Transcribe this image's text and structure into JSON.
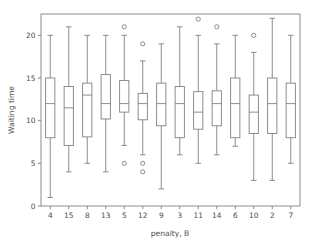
{
  "chart_data": {
    "type": "box",
    "title": "",
    "xlabel": "penalty, B",
    "ylabel": "Waiting time",
    "categories": [
      "4",
      "15",
      "8",
      "13",
      "5",
      "12",
      "9",
      "3",
      "11",
      "14",
      "6",
      "10",
      "2",
      "7"
    ],
    "ylim": [
      0,
      22.5
    ],
    "yticks": [
      0,
      5,
      10,
      15,
      20
    ],
    "ytick_labels": [
      "0",
      "5",
      "10",
      "15",
      "20"
    ],
    "grid": false,
    "legend": null,
    "boxes": [
      {
        "category": "4",
        "whisker_low": 1.0,
        "q1": 8.0,
        "median": 12.0,
        "q3": 15.0,
        "whisker_high": 20.0,
        "outliers": []
      },
      {
        "category": "15",
        "whisker_low": 4.0,
        "q1": 7.1,
        "median": 11.5,
        "q3": 14.0,
        "whisker_high": 21.0,
        "outliers": []
      },
      {
        "category": "8",
        "whisker_low": 5.0,
        "q1": 8.1,
        "median": 13.0,
        "q3": 14.4,
        "whisker_high": 20.0,
        "outliers": []
      },
      {
        "category": "13",
        "whisker_low": 4.0,
        "q1": 10.2,
        "median": 12.0,
        "q3": 15.4,
        "whisker_high": 20.0,
        "outliers": []
      },
      {
        "category": "5",
        "whisker_low": 7.1,
        "q1": 11.0,
        "median": 12.0,
        "q3": 14.7,
        "whisker_high": 20.0,
        "outliers": [
          21.0,
          5.0
        ]
      },
      {
        "category": "12",
        "whisker_low": 6.0,
        "q1": 10.1,
        "median": 12.0,
        "q3": 13.2,
        "whisker_high": 17.0,
        "outliers": [
          19.0,
          5.0,
          4.0
        ]
      },
      {
        "category": "9",
        "whisker_low": 2.0,
        "q1": 9.4,
        "median": 12.0,
        "q3": 14.4,
        "whisker_high": 19.0,
        "outliers": []
      },
      {
        "category": "3",
        "whisker_low": 6.0,
        "q1": 8.0,
        "median": 12.0,
        "q3": 14.0,
        "whisker_high": 21.0,
        "outliers": []
      },
      {
        "category": "11",
        "whisker_low": 5.0,
        "q1": 9.0,
        "median": 11.0,
        "q3": 13.4,
        "whisker_high": 20.0,
        "outliers": [
          21.9
        ]
      },
      {
        "category": "14",
        "whisker_low": 6.0,
        "q1": 9.4,
        "median": 12.0,
        "q3": 13.5,
        "whisker_high": 19.0,
        "outliers": [
          21.0
        ]
      },
      {
        "category": "6",
        "whisker_low": 7.0,
        "q1": 8.0,
        "median": 12.0,
        "q3": 15.0,
        "whisker_high": 20.0,
        "outliers": []
      },
      {
        "category": "10",
        "whisker_low": 3.0,
        "q1": 8.5,
        "median": 11.0,
        "q3": 13.0,
        "whisker_high": 18.0,
        "outliers": [
          20.0
        ]
      },
      {
        "category": "2",
        "whisker_low": 3.0,
        "q1": 8.5,
        "median": 12.0,
        "q3": 15.0,
        "whisker_high": 22.0,
        "outliers": []
      },
      {
        "category": "7",
        "whisker_low": 5.0,
        "q1": 8.0,
        "median": 12.0,
        "q3": 14.4,
        "whisker_high": 20.0,
        "outliers": []
      }
    ],
    "colors": {
      "stroke": "#808080",
      "box_fill": "#ffffff",
      "text": "#4d4d4d",
      "background": "#ffffff"
    }
  }
}
